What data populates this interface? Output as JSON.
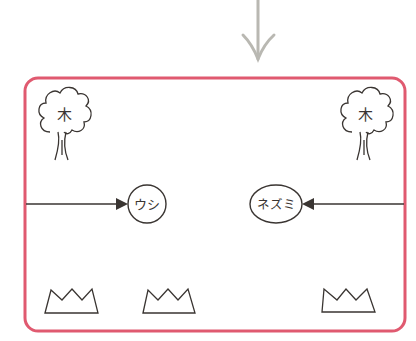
{
  "diagram": {
    "colors": {
      "frame": "#e05a70",
      "incoming_arrow": "#b9b8b2",
      "ink": "#3a3532"
    },
    "incoming_arrow": {
      "direction": "down"
    },
    "trees": [
      {
        "id": "tree-left",
        "label": "木"
      },
      {
        "id": "tree-right",
        "label": "木"
      }
    ],
    "nodes": [
      {
        "id": "ushi",
        "label": "ウシ"
      },
      {
        "id": "nezumi",
        "label": "ネズミ"
      }
    ],
    "arrows": [
      {
        "from": "left-edge",
        "to": "ushi"
      },
      {
        "from": "right-edge",
        "to": "nezumi"
      }
    ],
    "crowns": [
      {
        "id": "crown-1"
      },
      {
        "id": "crown-2"
      },
      {
        "id": "crown-3"
      }
    ]
  }
}
